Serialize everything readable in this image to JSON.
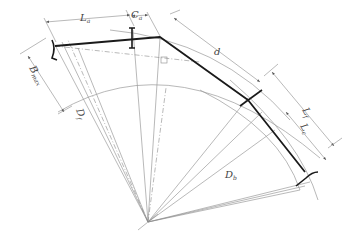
{
  "diagram": {
    "type": "engineering-geometry",
    "colors": {
      "line": "#8a8a8a",
      "profile": "#1a1a1a",
      "background": "#ffffff"
    },
    "labels": {
      "La": {
        "main": "L",
        "sub": "a"
      },
      "Ca": {
        "main": "C",
        "sub": "a"
      },
      "d": {
        "main": "d",
        "sub": ""
      },
      "Lf": {
        "main": "L",
        "sub": "f"
      },
      "Lc": {
        "main": "L",
        "sub": "c"
      },
      "Bmax": {
        "main": "B",
        "sub": "max"
      },
      "Df": {
        "main": "D",
        "sub": "f"
      },
      "Db": {
        "main": "D",
        "sub": "b"
      }
    }
  }
}
